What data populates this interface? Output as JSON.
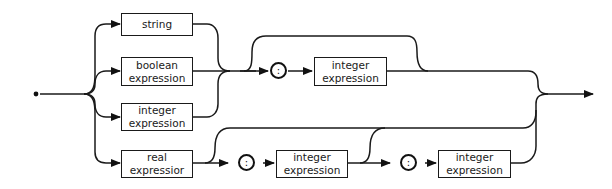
{
  "diagram": {
    "type": "syntax-diagram",
    "boxes": {
      "string": [
        "string"
      ],
      "boolean": [
        "boolean",
        "expression"
      ],
      "integer_left": [
        "integer",
        "expression"
      ],
      "real": [
        "real",
        "expressior"
      ],
      "integer_top": [
        "integer",
        "expression"
      ],
      "integer_bottom_1": [
        "integer",
        "expression"
      ],
      "integer_bottom_2": [
        "integer",
        "expression"
      ]
    },
    "separators": {
      "colon_top": ":",
      "colon_bottom_1": ":",
      "colon_bottom_2": ":"
    }
  }
}
